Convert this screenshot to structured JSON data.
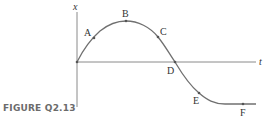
{
  "figure": {
    "caption": "FIGURE Q2.13",
    "axes": {
      "vertical_label": "x",
      "horizontal_label": "t"
    },
    "points": [
      {
        "label": "A"
      },
      {
        "label": "B"
      },
      {
        "label": "C"
      },
      {
        "label": "D"
      },
      {
        "label": "E"
      },
      {
        "label": "F"
      }
    ],
    "colors": {
      "curve": "#707070",
      "axes": "#8a8a8a",
      "caption": "#6b6b6b"
    }
  }
}
